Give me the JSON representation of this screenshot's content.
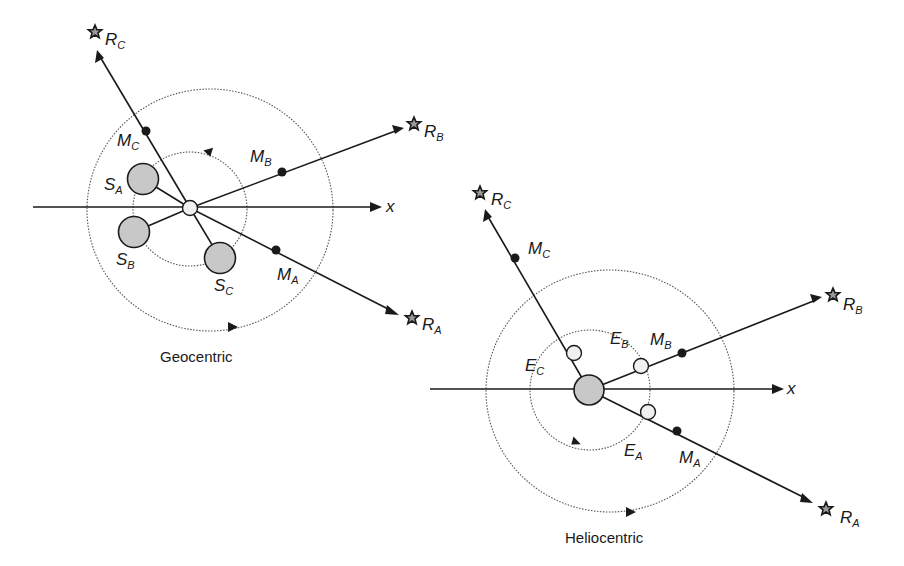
{
  "diagram": {
    "panels": [
      {
        "id": "geocentric",
        "caption": "Geocentric",
        "axis_label": "x",
        "center_body": "Earth",
        "labels": {
          "RC": {
            "main": "R",
            "sub": "C"
          },
          "RB": {
            "main": "R",
            "sub": "B"
          },
          "RA": {
            "main": "R",
            "sub": "A"
          },
          "MC": {
            "main": "M",
            "sub": "C"
          },
          "MB": {
            "main": "M",
            "sub": "B"
          },
          "MA": {
            "main": "M",
            "sub": "A"
          },
          "SA": {
            "main": "S",
            "sub": "A"
          },
          "SB": {
            "main": "S",
            "sub": "B"
          },
          "SC": {
            "main": "S",
            "sub": "C"
          }
        }
      },
      {
        "id": "heliocentric",
        "caption": "Heliocentric",
        "axis_label": "x",
        "center_body": "Sun",
        "labels": {
          "RC": {
            "main": "R",
            "sub": "C"
          },
          "RB": {
            "main": "R",
            "sub": "B"
          },
          "RA": {
            "main": "R",
            "sub": "A"
          },
          "MC": {
            "main": "M",
            "sub": "C"
          },
          "MB": {
            "main": "M",
            "sub": "B"
          },
          "MA": {
            "main": "M",
            "sub": "A"
          },
          "EC": {
            "main": "E",
            "sub": "C"
          },
          "EB": {
            "main": "E",
            "sub": "B"
          },
          "EA": {
            "main": "E",
            "sub": "A"
          }
        }
      }
    ],
    "colors": {
      "ink": "#1a1a1a",
      "planet_fill": "#c8c8c8",
      "earth_fill": "#f0f0f0",
      "star_fill": "#9a9a9a",
      "orbit": "#555555"
    }
  }
}
